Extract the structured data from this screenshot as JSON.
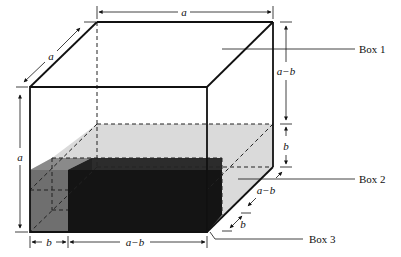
{
  "diagram": {
    "type": "3d-box-volume-decomposition",
    "labels": {
      "box1": "Box 1",
      "box2": "Box 2",
      "box3": "Box 3"
    },
    "dimensions": {
      "top_width": "a",
      "depth_top": "a",
      "height_left": "a",
      "right_upper": "a−b",
      "right_lower": "b",
      "depth_lower_1": "a−b",
      "depth_lower_2": "b",
      "bottom_left": "b",
      "bottom_right": "a−b"
    },
    "colors": {
      "outline": "#111111",
      "box2_fill": "#d9d9d9",
      "box2_left_fill": "#6e6e6e",
      "box3_fill": "#151515",
      "box3_top_fill": "#2e2e2e",
      "box3_side_fill": "#3a3a3a"
    }
  }
}
